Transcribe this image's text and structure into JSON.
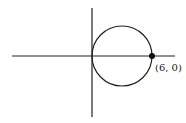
{
  "diagram": {
    "axes": {
      "x_axis": {
        "x1": 12,
        "x2": 175,
        "y": 56
      },
      "y_axis": {
        "x": 92,
        "y1": 8,
        "y2": 117
      }
    },
    "circle": {
      "cx": 122,
      "cy": 56,
      "r": 30
    },
    "point": {
      "x": 152,
      "y": 56,
      "r": 3,
      "label": "(6, 0)"
    },
    "colors": {
      "stroke": "#222222",
      "background": "#ffffff"
    }
  }
}
